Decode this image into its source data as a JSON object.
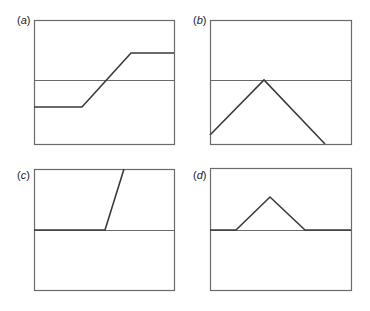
{
  "figure": {
    "panels": [
      {
        "id": "a",
        "label_open": "(",
        "label_letter": "a",
        "label_close": ")",
        "box": {
          "x": 34,
          "y": 20,
          "w": 140,
          "h": 124
        },
        "midline_y": 80,
        "curve": [
          [
            34,
            107
          ],
          [
            82,
            107
          ],
          [
            131,
            53
          ],
          [
            174,
            53
          ]
        ]
      },
      {
        "id": "b",
        "label_open": "(",
        "label_letter": "b",
        "label_close": ")",
        "box": {
          "x": 210,
          "y": 20,
          "w": 141,
          "h": 124
        },
        "midline_y": 80,
        "curve": [
          [
            210,
            135
          ],
          [
            264,
            80
          ],
          [
            325,
            144
          ]
        ]
      },
      {
        "id": "c",
        "label_open": "(",
        "label_letter": "c",
        "label_close": ")",
        "box": {
          "x": 34,
          "y": 169,
          "w": 140,
          "h": 121
        },
        "midline_y": 230,
        "curve": [
          [
            34,
            230
          ],
          [
            105,
            230
          ],
          [
            124,
            169
          ]
        ]
      },
      {
        "id": "d",
        "label_open": "(",
        "label_letter": "d",
        "label_close": ")",
        "box": {
          "x": 210,
          "y": 168,
          "w": 141,
          "h": 122
        },
        "midline_y": 230,
        "curve": [
          [
            210,
            230
          ],
          [
            236,
            230
          ],
          [
            270,
            197
          ],
          [
            305,
            230
          ],
          [
            351,
            230
          ]
        ]
      }
    ],
    "colors": {
      "frame": "#6a6a6a",
      "midline": "#6a6a6a",
      "curve": "#3a3a3a",
      "label": "#222222"
    }
  }
}
